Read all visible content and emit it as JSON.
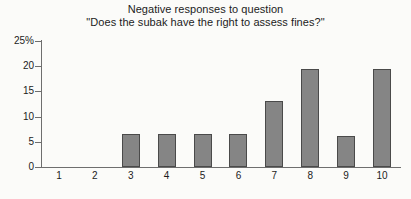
{
  "chart_data": {
    "type": "bar",
    "title": "Negative responses to question\n\"Does the subak have the right to assess fines?\"",
    "title_lines": [
      "Negative responses to question",
      "\"Does the subak have the right to assess fines?\""
    ],
    "categories": [
      "1",
      "2",
      "3",
      "4",
      "5",
      "6",
      "7",
      "8",
      "9",
      "10"
    ],
    "values": [
      0,
      0,
      6.5,
      6.5,
      6.5,
      6.5,
      13,
      19.5,
      6.2,
      19.5
    ],
    "xlabel": "",
    "ylabel": "",
    "ylim": [
      0,
      25
    ],
    "yticks": [
      0,
      5,
      10,
      15,
      20,
      25
    ],
    "ytick_labels": [
      "0",
      "5",
      "10",
      "15",
      "20",
      "25%"
    ],
    "grid": false,
    "legend": false,
    "bar_color": "#858585",
    "bar_edge_color": "#4a4a4a",
    "axis_color": "#6e6e6e",
    "background_color": "#fbfbf9"
  }
}
